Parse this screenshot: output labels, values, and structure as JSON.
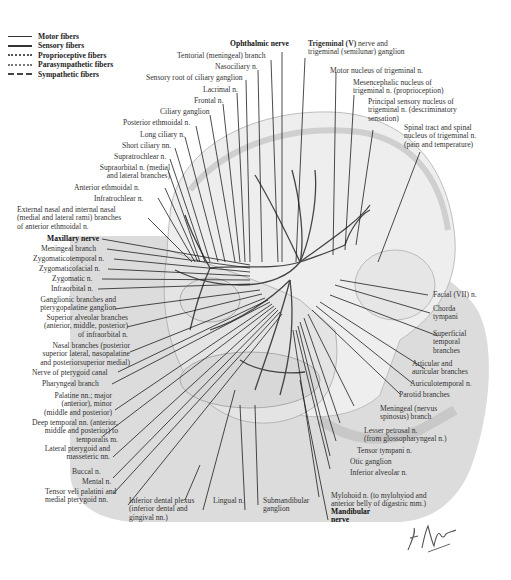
{
  "legend": [
    {
      "label": "Motor fibers",
      "style": "solid"
    },
    {
      "label": "Sensory fibers",
      "style": "solid-thick"
    },
    {
      "label": "Proprioceptive fibers",
      "style": "dotted"
    },
    {
      "label": "Parasympathetic fibers",
      "style": "dotted"
    },
    {
      "label": "Sympathetic fibers",
      "style": "dashed"
    }
  ],
  "labels": {
    "ophthalmic_nerve": "Ophthalmic nerve",
    "tentorial_branch": "Tentorial (meningeal) branch",
    "nasociliary": "Nasociliary n.",
    "sensory_root_ciliary": "Sensory root of ciliary ganglion",
    "lacrimal": "Lacrimal n.",
    "frontal": "Frontal n.",
    "ciliary_ganglion": "Ciliary ganglion",
    "posterior_ethmoidal": "Posterior ethmoidal n.",
    "long_ciliary": "Long ciliary n.",
    "short_ciliary": "Short ciliary nn.",
    "supratrochlear": "Supratrochlear n.",
    "supraorbital_1": "Supraorbital n. (medial",
    "supraorbital_2": "and lateral branches)",
    "anterior_ethmoidal": "Anterior ethmoidal n.",
    "infratrochlear": "Infratrochlear n.",
    "external_nasal_1": "External nasal and internal nasal",
    "external_nasal_2": "(medial and lateral rami) branches",
    "external_nasal_3": "of anterior ethmoidal n.",
    "maxillary_nerve": "Maxillary nerve",
    "meningeal_branch": "Meningeal branch",
    "zygomaticotemporal": "Zygomaticotemporal n.",
    "zygomaticofacial": "Zygomaticofacial n.",
    "zygomatic": "Zygomatic n.",
    "infraorbital": "Infraorbital n.",
    "ganglionic_1": "Ganglionic branches and",
    "ganglionic_2": "pterygopalatine ganglion",
    "sup_alveolar_1": "Superior alveolar branches",
    "sup_alveolar_2": "(anterior, middle, posterior)",
    "sup_alveolar_3": "of infraorbital n.",
    "nasal_branches_1": "Nasal branches (posterior",
    "nasal_branches_2": "superior lateral, nasopalatine",
    "nasal_branches_3": "and posteriorsuperior medial)",
    "pterygoid_canal": "Nerve of pterygoid canal",
    "pharyngeal": "Pharyngeal branch",
    "palatine_1": "Palatine nn.; major",
    "palatine_2": "(anterior), minor",
    "palatine_3": "(middle and posterior)",
    "deep_temporal_1": "Deep temporal nn. (anterior,",
    "deep_temporal_2": "middle and posterior) to",
    "deep_temporal_3": "temporalis m.",
    "lat_pterygoid_1": "Lateral pterygoid and",
    "lat_pterygoid_2": "masseteric nn.",
    "buccal": "Buccal n.",
    "mental": "Mental n.",
    "tensor_veli_1": "Tensor veli palatini and",
    "tensor_veli_2": "medial pterygoid nn.",
    "inf_dental_1": "Inferior dental plexus",
    "inf_dental_2": "(inferior dental and",
    "inf_dental_3": "gingival nn.)",
    "lingual": "Lingual n.",
    "submandibular_1": "Submandibular",
    "submandibular_2": "ganglion",
    "mandibular_1": "Mandibular",
    "mandibular_2": "nerve",
    "trigeminal_bold": "Trigeminal (V)",
    "trigeminal_1": " nerve and",
    "trigeminal_2": "trigeminal (semilunar) ganglion",
    "motor_nucleus": "Motor nucleus of trigeminal n.",
    "mesencephalic_1": "Mesencephalic nucleus of",
    "mesencephalic_2": "trigeminal n. (proprioception)",
    "principal_1": "Principal sensory nucleus of",
    "principal_2": "trigeminal n. (descriminatory",
    "principal_3": "sensation)",
    "spinal_1": "Spinal tract and spinal",
    "spinal_2": "nucleus of trigeminal n.",
    "spinal_3": "(pain and temperature)",
    "facial": "Facial (VII) n.",
    "chorda_1": "Chorda",
    "chorda_2": "tympani",
    "superficial_1": "Superficial",
    "superficial_2": "temporal",
    "superficial_3": "branches",
    "articular_1": "Articular and",
    "articular_2": "auricular branches",
    "auriculotemporal": "Auriculotemporal n.",
    "parotid": "Parotid branches",
    "meningeal_spinosus_1": "Meningeal (nervus",
    "meningeal_spinosus_2": "spinosus) branch",
    "lesser_petrosal_1": "Lesser petrosal n.",
    "lesser_petrosal_2": "(from glossopharyngeal n.)",
    "tensor_tympani": "Tensor tympani n.",
    "otic_ganglion": "Otic ganglion",
    "inferior_alveolar": "Inferior alveolar n.",
    "mylohoid_1": "Mylohoid n. (to mylohyiod and",
    "mylohoid_2": "anterior belly of digastric mm.)"
  },
  "signature": "F. Netter M.D.",
  "colors": {
    "panel_gray": "#dcdcdc",
    "skull": "#ececec",
    "line": "#1e1e1e"
  }
}
